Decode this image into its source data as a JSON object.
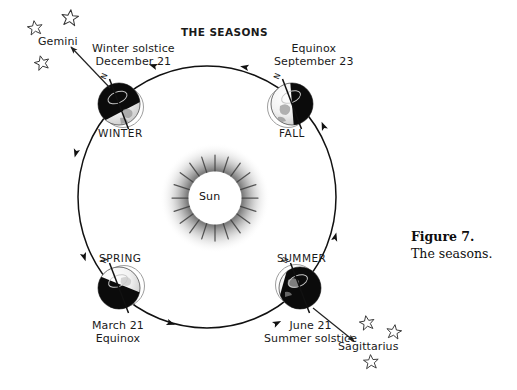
{
  "figure": {
    "title": "THE SEASONS",
    "caption_number": "Figure 7.",
    "caption_text": "The seasons."
  },
  "sun": {
    "label": "Sun",
    "core_color": "#ffffff",
    "halo_color": "#9a9a9a",
    "ray_color": "#4a4a4a"
  },
  "orbit": {
    "stroke_color": "#111111",
    "direction": "counterclockwise",
    "arrow_count": 8
  },
  "positions": [
    {
      "id": "winter",
      "season_label": "WINTER",
      "event_line1": "Winter solstice",
      "event_line2": "December 21",
      "axis_label": "N",
      "lit_side": "right"
    },
    {
      "id": "fall",
      "season_label": "FALL",
      "event_line1": "Equinox",
      "event_line2": "September 23",
      "axis_label": "N",
      "lit_side": "left"
    },
    {
      "id": "spring",
      "season_label": "SPRING",
      "event_line1": "March 21",
      "event_line2": "Equinox",
      "axis_label": "N",
      "lit_side": "right"
    },
    {
      "id": "summer",
      "season_label": "SUMMER",
      "event_line1": "June 21",
      "event_line2": "Summer solstice",
      "axis_label": "N",
      "lit_side": "left"
    }
  ],
  "constellations": [
    {
      "id": "gemini",
      "label": "Gemini",
      "star_count": 3
    },
    {
      "id": "sagittarius",
      "label": "Sagittarius",
      "star_count": 3
    }
  ]
}
